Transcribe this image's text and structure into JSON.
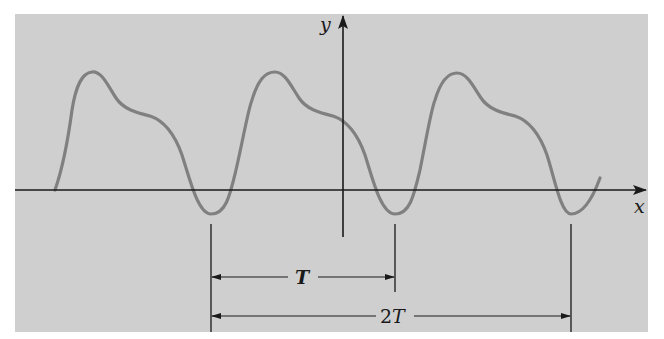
{
  "figure": {
    "panel_color": "#cfcfcf",
    "curve_color": "#808080",
    "axis_color": "#1a1a1a",
    "axes": {
      "x_label": "x",
      "y_label": "y"
    },
    "dimensions": {
      "period_label": "T",
      "double_period_label": "2T"
    }
  },
  "chart_data": {
    "type": "line",
    "title": "",
    "xlabel": "x",
    "ylabel": "y",
    "grid": false,
    "annotations": [
      "T",
      "2T"
    ],
    "period_px": 180
  }
}
